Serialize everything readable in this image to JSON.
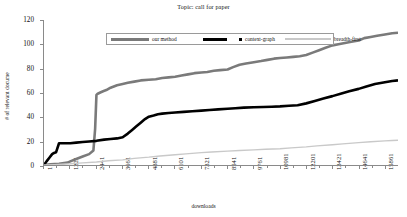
{
  "chart_data": {
    "type": "line",
    "title": "Topic: call for paper",
    "xlabel": "downloads",
    "ylabel": "# of relevant docume",
    "xlim": [
      1,
      16471
    ],
    "ylim": [
      0,
      120
    ],
    "grid": false,
    "legend_position": "inside-top-center",
    "xticklabels": [
      "1",
      "1221",
      "2441",
      "3661",
      "4881",
      "6101",
      "7321",
      "8541",
      "9761",
      "10981",
      "12201",
      "13421",
      "14641",
      "15861"
    ],
    "xtickvalues": [
      1,
      1221,
      2441,
      3661,
      4881,
      6101,
      7321,
      8541,
      9761,
      10981,
      12201,
      13421,
      14641,
      15861
    ],
    "yticklabels": [
      "0",
      "20",
      "40",
      "60",
      "80",
      "100",
      "120"
    ],
    "ytickvalues": [
      0,
      20,
      40,
      60,
      80,
      100,
      120
    ],
    "series": [
      {
        "name": "our method",
        "color": "#7a7a7a",
        "width": 2.6,
        "x": [
          1,
          300,
          700,
          1100,
          1221,
          1500,
          1800,
          2100,
          2300,
          2380,
          2441,
          2500,
          2620,
          2750,
          2900,
          3100,
          3400,
          3661,
          3900,
          4200,
          4500,
          4881,
          5200,
          5500,
          5800,
          6101,
          6400,
          6700,
          7000,
          7321,
          7600,
          7900,
          8200,
          8541,
          8800,
          9100,
          9400,
          9761,
          10100,
          10400,
          10700,
          10981,
          11300,
          11600,
          11900,
          12201,
          12500,
          12800,
          13100,
          13421,
          13700,
          14000,
          14300,
          14641,
          14900,
          15200,
          15500,
          15861,
          16200,
          16471
        ],
        "y": [
          0,
          0.5,
          1,
          2,
          3,
          5,
          7,
          9,
          12,
          30,
          58,
          59,
          60,
          61,
          62,
          64,
          66,
          67,
          68,
          69,
          70,
          70.5,
          71,
          72,
          72.5,
          73,
          74,
          75,
          76,
          76.5,
          77,
          78,
          78.5,
          79,
          81,
          83,
          84,
          85,
          86,
          87,
          88,
          88.5,
          89,
          89.5,
          90,
          91,
          93,
          95,
          97,
          99,
          100,
          101,
          102,
          103,
          105,
          106,
          107,
          108,
          109,
          109.5
        ]
      },
      {
        "name": "context-graph",
        "color": "#000000",
        "width": 2.6,
        "x": [
          1,
          120,
          250,
          380,
          470,
          560,
          700,
          900,
          1100,
          1221,
          1500,
          1800,
          2100,
          2441,
          2800,
          3100,
          3400,
          3661,
          3900,
          4100,
          4300,
          4500,
          4700,
          4881,
          5100,
          5300,
          5500,
          5800,
          6101,
          6500,
          6900,
          7321,
          7700,
          8100,
          8541,
          8900,
          9300,
          9761,
          10200,
          10600,
          10981,
          11400,
          11800,
          12201,
          12600,
          13000,
          13421,
          13800,
          14200,
          14641,
          15000,
          15400,
          15861,
          16200,
          16471
        ],
        "y": [
          0,
          3,
          6,
          9,
          10,
          10.5,
          18,
          18,
          18,
          18,
          18.5,
          19,
          19.5,
          20,
          21,
          21.5,
          22,
          23,
          26,
          29,
          32,
          35,
          38,
          40,
          41,
          42,
          42.5,
          43,
          43.5,
          44,
          44.5,
          45,
          45.5,
          46,
          46.5,
          47,
          47.5,
          47.8,
          48,
          48.2,
          48.5,
          49,
          49.5,
          51,
          53,
          55,
          57,
          59,
          61,
          63,
          65,
          67,
          68.5,
          69.5,
          70
        ]
      },
      {
        "name": "breadth-first",
        "color": "#c9c9c9",
        "width": 1.4,
        "x": [
          1,
          500,
          1000,
          1221,
          1800,
          2441,
          3000,
          3661,
          4200,
          4881,
          5400,
          6101,
          6600,
          7321,
          7800,
          8541,
          9100,
          9761,
          10300,
          10981,
          11500,
          12201,
          12700,
          13421,
          13900,
          14641,
          15200,
          15861,
          16200,
          16471
        ],
        "y": [
          0,
          0.3,
          0.8,
          1,
          1.8,
          2.5,
          3.5,
          4.2,
          5.5,
          6.5,
          7.5,
          8.5,
          9.2,
          10.2,
          10.8,
          11.5,
          12,
          12.5,
          13,
          13.5,
          14.2,
          15,
          15.8,
          16.8,
          17.5,
          18.5,
          19.2,
          20,
          20.3,
          20.5
        ]
      }
    ]
  },
  "legend": {
    "items": [
      {
        "label": "our method",
        "color": "#7a7a7a",
        "style": "thick-line",
        "swatch_width": 38,
        "swatch_height": 3
      },
      {
        "label": "context-graph",
        "color": "#000000",
        "style": "thick-line-and-dot",
        "swatch_width": 24,
        "swatch_height": 3
      },
      {
        "label": "breadth-first",
        "color": "#c9c9c9",
        "style": "thin-line",
        "swatch_width": 46,
        "swatch_height": 2
      }
    ]
  }
}
